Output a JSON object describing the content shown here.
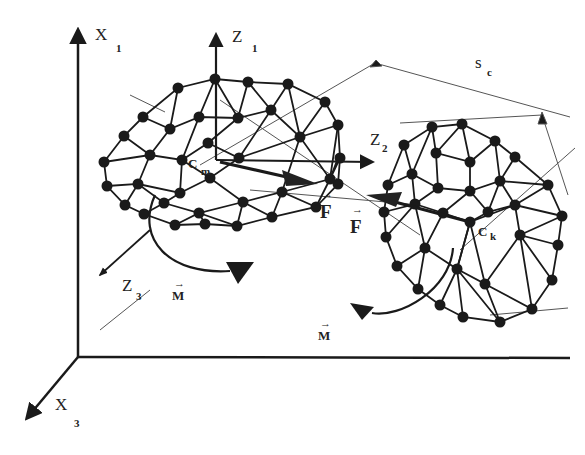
{
  "figure": {
    "colors": {
      "ink": "#1a1a1a",
      "background": "#ffffff",
      "thin_line": "#555555"
    }
  },
  "global_axes": {
    "x1": {
      "label": "X",
      "sub": "1"
    },
    "x3": {
      "label": "X",
      "sub": "3"
    }
  },
  "local_axes": {
    "z1": {
      "label": "Z",
      "sub": "1"
    },
    "z2": {
      "label": "Z",
      "sub": "2"
    },
    "z3": {
      "label": "Z",
      "sub": "3"
    }
  },
  "particles": [
    {
      "id": "m",
      "center_label": "C",
      "center_sub": "m",
      "force_label": "F",
      "moment_label": "M"
    },
    {
      "id": "k",
      "center_label": "C",
      "center_sub": "k",
      "force_label": "F",
      "moment_label": "M"
    }
  ],
  "contact_surface": {
    "label": "s",
    "sub": "c"
  },
  "vector_arrow_glyph": "→"
}
